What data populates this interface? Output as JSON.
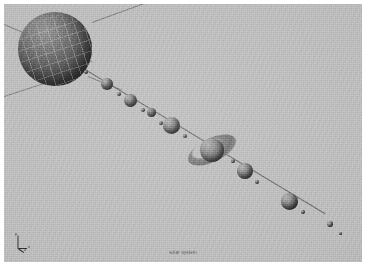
{
  "render": {
    "title": "Solar System Scale Render",
    "caption": "solar system",
    "background_color": "#b9b9b9",
    "frame_color": "#ffffff",
    "line_color": "#6f6f6f",
    "body_color": "#6e6e6e",
    "style": "greyscale raytraced"
  },
  "gizmo": {
    "name": "axis-triad",
    "x_label": "x",
    "y_label": "y",
    "z_label": "z"
  },
  "grid_lines": [
    {
      "name": "grid-upper-left",
      "x": 0,
      "y": 22,
      "length": 92,
      "angle": 24
    },
    {
      "name": "grid-upper-right",
      "x": 96,
      "y": 46,
      "length": 92,
      "angle": -22
    },
    {
      "name": "grid-lower-left",
      "x": 0,
      "y": 88,
      "length": 74,
      "angle": -17
    },
    {
      "name": "grid-lower-right",
      "x": 86,
      "y": 76,
      "length": 34,
      "angle": 20
    }
  ],
  "orbit_line": {
    "name": "planet-chain-line",
    "x": 78,
    "y": 66,
    "length": 272,
    "angle": 30
  },
  "bodies": [
    {
      "name": "sun",
      "label": "Sun",
      "x": 18,
      "y": 12,
      "size": 72,
      "kind": "star"
    },
    {
      "name": "moon-a",
      "label": "",
      "x": 83,
      "y": 70,
      "size": 4,
      "kind": "moon"
    },
    {
      "name": "planet-1",
      "label": "Mercury",
      "x": 104,
      "y": 80,
      "size": 11,
      "kind": "planet"
    },
    {
      "name": "moon-b",
      "label": "",
      "x": 118,
      "y": 92,
      "size": 4,
      "kind": "moon"
    },
    {
      "name": "planet-2",
      "label": "Venus",
      "x": 126,
      "y": 96,
      "size": 12,
      "kind": "planet"
    },
    {
      "name": "moon-c",
      "label": "",
      "x": 141,
      "y": 108,
      "size": 4,
      "kind": "moon"
    },
    {
      "name": "planet-3",
      "label": "Earth",
      "x": 148,
      "y": 110,
      "size": 9,
      "kind": "planet"
    },
    {
      "name": "moon-d",
      "label": "",
      "x": 160,
      "y": 121,
      "size": 4,
      "kind": "moon"
    },
    {
      "name": "planet-4",
      "label": "Mars",
      "x": 165,
      "y": 118,
      "size": 16,
      "kind": "planet"
    },
    {
      "name": "moon-e",
      "label": "",
      "x": 183,
      "y": 133,
      "size": 4,
      "kind": "moon"
    },
    {
      "name": "ringed-planet",
      "label": "Saturn",
      "x": 200,
      "y": 136,
      "size": 23,
      "kind": "ringed"
    },
    {
      "name": "moon-f",
      "label": "",
      "x": 230,
      "y": 158,
      "size": 4,
      "kind": "moon"
    },
    {
      "name": "planet-5",
      "label": "Uranus",
      "x": 238,
      "y": 164,
      "size": 15,
      "kind": "planet"
    },
    {
      "name": "moon-g",
      "label": "",
      "x": 255,
      "y": 180,
      "size": 4,
      "kind": "moon"
    },
    {
      "name": "planet-6",
      "label": "Neptune",
      "x": 282,
      "y": 194,
      "size": 16,
      "kind": "planet"
    },
    {
      "name": "moon-h",
      "label": "",
      "x": 300,
      "y": 209,
      "size": 4,
      "kind": "moon"
    },
    {
      "name": "planet-7",
      "label": "Pluto",
      "x": 326,
      "y": 221,
      "size": 5,
      "kind": "planet"
    },
    {
      "name": "moon-i",
      "label": "",
      "x": 338,
      "y": 231,
      "size": 3,
      "kind": "moon"
    }
  ],
  "ring": {
    "name": "saturn-ring",
    "x": 186,
    "y": 130,
    "width": 50,
    "height": 36
  }
}
